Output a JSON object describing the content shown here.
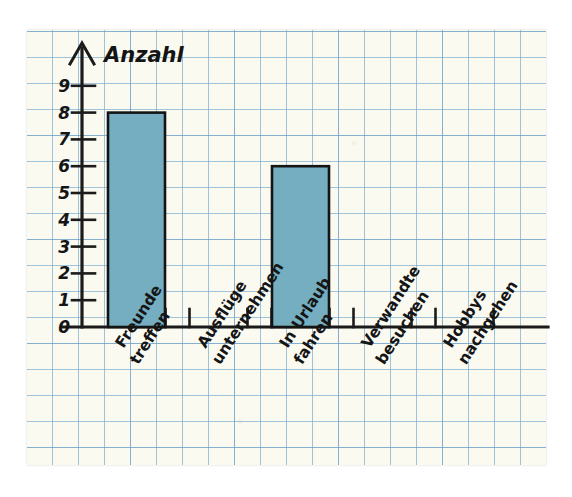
{
  "chart_data": {
    "type": "bar",
    "title": "",
    "ylabel": "Anzahl",
    "xlabel": "",
    "categories": [
      "Freunde treffen",
      "Ausflüge unternehmen",
      "In Urlaub fahren",
      "Verwandte besuchen",
      "Hobbys nachgehen"
    ],
    "category_lines": [
      [
        "Freunde",
        "treffen"
      ],
      [
        "Ausflüge",
        "unternehmen"
      ],
      [
        "In Urlaub",
        "fahren"
      ],
      [
        "Verwandte",
        "besuchen"
      ],
      [
        "Hobbys",
        "nachgehen"
      ]
    ],
    "values": [
      8,
      0,
      6,
      0,
      0
    ],
    "ylim": [
      0,
      9
    ],
    "ytick_labels": [
      "0",
      "1",
      "2",
      "3",
      "4",
      "5",
      "6",
      "7",
      "8",
      "9"
    ],
    "grid": true,
    "legend": false,
    "bar_color": "#74aec0",
    "bar_edge_color": "#141414",
    "ink_color": "#1b1b1b",
    "paper_color": "#fbfaf1",
    "grid_color": "#78aacd"
  }
}
